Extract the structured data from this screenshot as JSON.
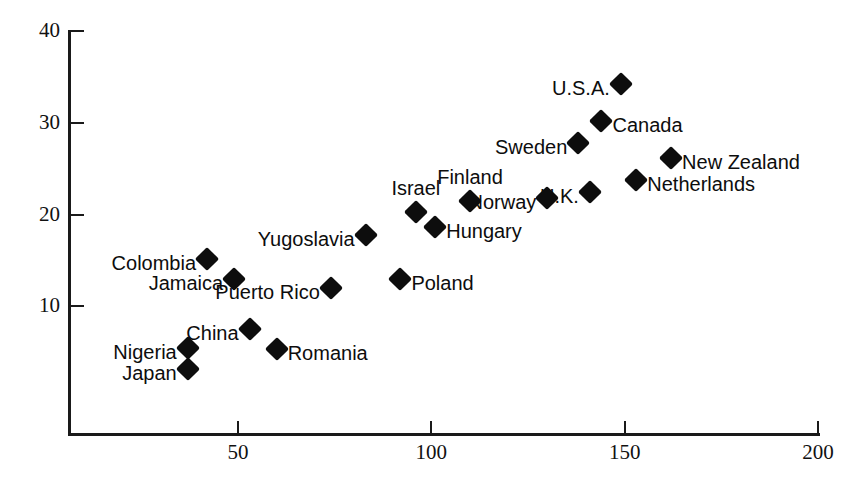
{
  "chart_data": {
    "type": "scatter",
    "title": "",
    "xlabel": "",
    "ylabel": "",
    "xlim": [
      0,
      200
    ],
    "ylim": [
      0,
      40
    ],
    "grid": false,
    "legend": "none",
    "xticks": [
      50,
      100,
      150,
      200
    ],
    "yticks": [
      10,
      20,
      30,
      40
    ],
    "xtick_labels": [
      "50",
      "100",
      "150",
      "200"
    ],
    "ytick_labels": [
      "10",
      "20",
      "30",
      "40"
    ],
    "points": [
      {
        "label": "Japan",
        "x": 37,
        "y": 3.2,
        "label_pos": "left"
      },
      {
        "label": "Nigeria",
        "x": 37,
        "y": 5.4,
        "label_pos": "left"
      },
      {
        "label": "China",
        "x": 53,
        "y": 7.5,
        "label_pos": "left"
      },
      {
        "label": "Romania",
        "x": 60,
        "y": 5.3,
        "label_pos": "right"
      },
      {
        "label": "Colombia",
        "x": 42,
        "y": 15.2,
        "label_pos": "left"
      },
      {
        "label": "Jamaica",
        "x": 49,
        "y": 13.0,
        "label_pos": "left"
      },
      {
        "label": "Puerto Rico",
        "x": 74,
        "y": 12.0,
        "label_pos": "left"
      },
      {
        "label": "Poland",
        "x": 92,
        "y": 13.0,
        "label_pos": "right"
      },
      {
        "label": "Yugoslavia",
        "x": 83,
        "y": 17.8,
        "label_pos": "left"
      },
      {
        "label": "Israel",
        "x": 96,
        "y": 20.3,
        "label_pos": "above"
      },
      {
        "label": "Hungary",
        "x": 101,
        "y": 18.6,
        "label_pos": "right"
      },
      {
        "label": "Finland",
        "x": 110,
        "y": 21.5,
        "label_pos": "above"
      },
      {
        "label": "Norway",
        "x": 130,
        "y": 21.8,
        "label_pos": "left"
      },
      {
        "label": "U.K.",
        "x": 141,
        "y": 22.5,
        "label_pos": "left"
      },
      {
        "label": "Sweden",
        "x": 138,
        "y": 27.8,
        "label_pos": "left"
      },
      {
        "label": "Canada",
        "x": 144,
        "y": 30.2,
        "label_pos": "right"
      },
      {
        "label": "U.S.A.",
        "x": 149,
        "y": 34.2,
        "label_pos": "left"
      },
      {
        "label": "Netherlands",
        "x": 153,
        "y": 23.8,
        "label_pos": "right"
      },
      {
        "label": "New Zealand",
        "x": 162,
        "y": 26.2,
        "label_pos": "right"
      }
    ]
  },
  "colors": {
    "marker": "#0d0d0d",
    "axis": "#1a1a1a",
    "background": "#ffffff",
    "text": "#111111"
  }
}
